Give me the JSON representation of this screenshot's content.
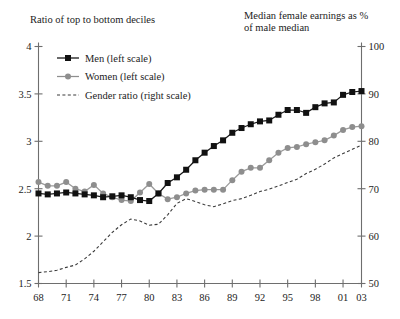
{
  "titles": {
    "left": "Ratio of top to bottom deciles",
    "right": "Median female earnings as %\nof male median"
  },
  "legend": [
    {
      "key": "men",
      "label": "Men (left scale)",
      "marker": "filled-square-marker",
      "color": "#111111"
    },
    {
      "key": "women",
      "label": "Women (left scale)",
      "marker": "filled-circle-marker",
      "color": "#8e8e8e"
    },
    {
      "key": "gender",
      "label": "Gender ratio (right scale)",
      "marker": "dashed-line-marker",
      "color": "#3a3a3a"
    }
  ],
  "chart_data": {
    "type": "line",
    "title": "",
    "xlabel": "",
    "ylabel": "Ratio of top to bottom deciles",
    "y2label": "Median female earnings as % of male median",
    "grid": false,
    "legend_position": "top-left",
    "xlim": [
      1968,
      2003
    ],
    "ylim": [
      1.5,
      4
    ],
    "y2lim": [
      50,
      100
    ],
    "yticks": [
      1.5,
      2,
      2.5,
      3,
      3.5,
      4
    ],
    "ytick_labels": [
      "1.5",
      "2",
      "2.5",
      "3",
      "3.5",
      "4"
    ],
    "y2ticks": [
      50,
      60,
      70,
      80,
      90,
      100
    ],
    "y2tick_labels": [
      "50",
      "60",
      "70",
      "80",
      "90",
      "100"
    ],
    "xticks": [
      1968,
      1971,
      1974,
      1977,
      1980,
      1983,
      1986,
      1989,
      1992,
      1995,
      1998,
      2001,
      2003
    ],
    "xtick_labels": [
      "68",
      "71",
      "74",
      "77",
      "80",
      "83",
      "86",
      "89",
      "92",
      "95",
      "98",
      "01",
      "03"
    ],
    "x": [
      1968,
      1969,
      1970,
      1971,
      1972,
      1973,
      1974,
      1975,
      1976,
      1977,
      1978,
      1979,
      1980,
      1981,
      1982,
      1983,
      1984,
      1985,
      1986,
      1987,
      1988,
      1989,
      1990,
      1991,
      1992,
      1993,
      1994,
      1995,
      1996,
      1997,
      1998,
      1999,
      2000,
      2001,
      2002,
      2003
    ],
    "series": [
      {
        "name": "Men (left scale)",
        "axis": "left",
        "marker": "square",
        "color": "#111111",
        "values": [
          2.45,
          2.44,
          2.45,
          2.46,
          2.45,
          2.44,
          2.43,
          2.41,
          2.42,
          2.43,
          2.41,
          2.38,
          2.37,
          2.45,
          2.56,
          2.62,
          2.7,
          2.8,
          2.88,
          2.95,
          3.01,
          3.09,
          3.14,
          3.18,
          3.21,
          3.22,
          3.28,
          3.33,
          3.33,
          3.3,
          3.36,
          3.4,
          3.41,
          3.49,
          3.52,
          3.53
        ]
      },
      {
        "name": "Women (left scale)",
        "axis": "left",
        "marker": "circle",
        "color": "#8e8e8e",
        "values": [
          2.57,
          2.53,
          2.53,
          2.57,
          2.5,
          2.47,
          2.54,
          2.45,
          2.41,
          2.38,
          2.37,
          2.46,
          2.55,
          2.45,
          2.39,
          2.41,
          2.45,
          2.48,
          2.49,
          2.49,
          2.49,
          2.59,
          2.68,
          2.72,
          2.72,
          2.8,
          2.88,
          2.93,
          2.94,
          2.97,
          2.99,
          3.01,
          3.06,
          3.12,
          3.15,
          3.16
        ]
      },
      {
        "name": "Gender ratio (right scale)",
        "axis": "right",
        "marker": "none",
        "color": "#3a3a3a",
        "values": [
          52.3,
          52.5,
          52.8,
          53.4,
          53.9,
          55.2,
          56.8,
          58.8,
          60.8,
          62.4,
          63.6,
          63.2,
          62.3,
          62.5,
          64.5,
          66.9,
          67.9,
          67.3,
          66.6,
          66.2,
          66.8,
          67.5,
          67.9,
          68.6,
          69.4,
          69.9,
          70.6,
          71.3,
          72.0,
          73.2,
          74.1,
          75.2,
          76.5,
          77.4,
          78.3,
          79.2
        ]
      }
    ]
  }
}
